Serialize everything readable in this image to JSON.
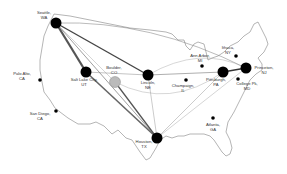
{
  "diagram": {
    "type": "network-map",
    "background": "#ffffff",
    "outline_color": "#555555",
    "nodes": [
      {
        "id": "seattle",
        "city": "Seattle,",
        "state": "WA",
        "x": 56,
        "y": 23,
        "r": 5.5,
        "fill": "#000000",
        "label_x": 44,
        "label_y": 11
      },
      {
        "id": "paloalto",
        "city": "Palo Alto,",
        "state": "CA",
        "x": 40,
        "y": 80,
        "r": 1.8,
        "fill": "#000000",
        "label_x": 22,
        "label_y": 72
      },
      {
        "id": "sandiego",
        "city": "San Diego,",
        "state": "CA",
        "x": 56,
        "y": 111,
        "r": 1.8,
        "fill": "#000000",
        "label_x": 40,
        "label_y": 112
      },
      {
        "id": "saltlake",
        "city": "Salt Lake City,",
        "state": "UT",
        "x": 86,
        "y": 72,
        "r": 5.5,
        "fill": "#000000",
        "label_x": 84,
        "label_y": 78
      },
      {
        "id": "boulder",
        "city": "Boulder,",
        "state": "CO",
        "x": 115,
        "y": 82,
        "r": 5.5,
        "fill": "#bbbbbb",
        "label_x": 114,
        "label_y": 66
      },
      {
        "id": "lincoln",
        "city": "Lincoln,",
        "state": "NE",
        "x": 148,
        "y": 75,
        "r": 5.5,
        "fill": "#000000",
        "label_x": 148,
        "label_y": 81
      },
      {
        "id": "champaign",
        "city": "Champaign,",
        "state": "IL",
        "x": 186,
        "y": 80,
        "r": 1.8,
        "fill": "#000000",
        "label_x": 183,
        "label_y": 84
      },
      {
        "id": "annarbor",
        "city": "Ann Arbor,",
        "state": "MI",
        "x": 202,
        "y": 66,
        "r": 1.8,
        "fill": "#000000",
        "label_x": 200,
        "label_y": 54
      },
      {
        "id": "ithaca",
        "city": "Ithaca,",
        "state": "NY",
        "x": 236,
        "y": 56,
        "r": 1.8,
        "fill": "#000000",
        "label_x": 228,
        "label_y": 46
      },
      {
        "id": "pittsburgh",
        "city": "Pittsburgh,",
        "state": "PA",
        "x": 223,
        "y": 72,
        "r": 5.5,
        "fill": "#000000",
        "label_x": 216,
        "label_y": 78
      },
      {
        "id": "princeton",
        "city": "Princeton,",
        "state": "NJ",
        "x": 246,
        "y": 68,
        "r": 5.5,
        "fill": "#000000",
        "label_x": 264,
        "label_y": 66
      },
      {
        "id": "collegepk",
        "city": "College Pk,",
        "state": "MD",
        "x": 238,
        "y": 79,
        "r": 1.8,
        "fill": "#000000",
        "label_x": 247,
        "label_y": 82
      },
      {
        "id": "atlanta",
        "city": "Atlanta,",
        "state": "GA",
        "x": 213,
        "y": 118,
        "r": 1.8,
        "fill": "#000000",
        "label_x": 213,
        "label_y": 123
      },
      {
        "id": "houston",
        "city": "Houston,",
        "state": "TX",
        "x": 157,
        "y": 138,
        "r": 5.5,
        "fill": "#000000",
        "label_x": 144,
        "label_y": 140
      }
    ],
    "links": [
      {
        "from": "seattle",
        "to": "saltlake",
        "width": 2.2,
        "color": "#555555"
      },
      {
        "from": "seattle",
        "to": "lincoln",
        "width": 1.4,
        "color": "#444444"
      },
      {
        "from": "seattle",
        "to": "houston",
        "width": 0.8,
        "color": "#888888"
      },
      {
        "from": "seattle",
        "to": "boulder",
        "width": 0.5,
        "color": "#aaaaaa"
      },
      {
        "from": "saltlake",
        "to": "houston",
        "width": 1.6,
        "color": "#666666"
      },
      {
        "from": "saltlake",
        "to": "lincoln",
        "width": 0.5,
        "color": "#888888"
      },
      {
        "from": "boulder",
        "to": "houston",
        "width": 1.3,
        "color": "#555555"
      },
      {
        "from": "lincoln",
        "to": "pittsburgh",
        "width": 0.6,
        "color": "#777777"
      },
      {
        "from": "lincoln",
        "to": "houston",
        "width": 0.5,
        "color": "#999999"
      },
      {
        "from": "pittsburgh",
        "to": "princeton",
        "width": 1.4,
        "color": "#333333"
      },
      {
        "from": "houston",
        "to": "pittsburgh",
        "width": 0.5,
        "color": "#999999"
      },
      {
        "from": "houston",
        "to": "princeton",
        "width": 0.5,
        "color": "#aaaaaa"
      }
    ],
    "arcs": [
      {
        "d": "M 56 23 Q 150 20 246 68",
        "width": 0.5,
        "color": "#777777"
      },
      {
        "d": "M 148 75 Q 200 45 246 68",
        "width": 0.4,
        "color": "#999999"
      },
      {
        "d": "M 115 82 Q 170 110 223 72",
        "width": 0.4,
        "color": "#999999"
      }
    ]
  }
}
